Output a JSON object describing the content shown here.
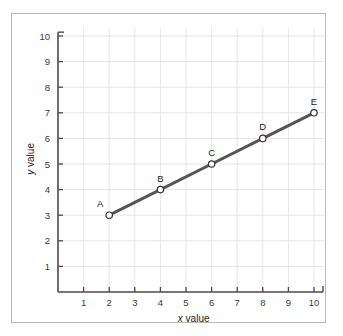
{
  "figure": {
    "background_color": "#ffffff",
    "frame_color": "#b9b9b9"
  },
  "chart_data": {
    "type": "line",
    "title": "",
    "subtitle": "",
    "xlabel": "x value",
    "ylabel": "y value",
    "xlabel_variable": "x",
    "xlabel_text": "value",
    "ylabel_variable": "y",
    "ylabel_text": "value",
    "xlim": [
      0,
      10.6
    ],
    "ylim": [
      0,
      10.4
    ],
    "xticks": [
      1,
      2,
      3,
      4,
      5,
      6,
      7,
      8,
      9,
      10
    ],
    "yticks": [
      1,
      2,
      3,
      4,
      5,
      6,
      7,
      8,
      9,
      10
    ],
    "xtick_labels": [
      "1",
      "2",
      "3",
      "4",
      "5",
      "6",
      "7",
      "8",
      "9",
      "10"
    ],
    "ytick_labels": [
      "1",
      "2",
      "3",
      "4",
      "5",
      "6",
      "7",
      "8",
      "9",
      "10"
    ],
    "grid": true,
    "grid_color": "#e6e6e6",
    "axis_color": "#4a4a4a",
    "legend": false,
    "legend_position": "none",
    "line_color": "#555555",
    "line_width": 3,
    "marker": "circle-open",
    "marker_fill": "#ffffff",
    "marker_edge_color": "#333333",
    "x": [
      2,
      4,
      6,
      8,
      10
    ],
    "values": [
      3,
      4,
      5,
      6,
      7
    ],
    "point_labels": [
      "A",
      "B",
      "C",
      "D",
      "E"
    ],
    "points": [
      {
        "label": "A",
        "x": 2,
        "y": 3
      },
      {
        "label": "B",
        "x": 4,
        "y": 4
      },
      {
        "label": "C",
        "x": 6,
        "y": 5
      },
      {
        "label": "D",
        "x": 8,
        "y": 6
      },
      {
        "label": "E",
        "x": 10,
        "y": 7
      }
    ]
  }
}
